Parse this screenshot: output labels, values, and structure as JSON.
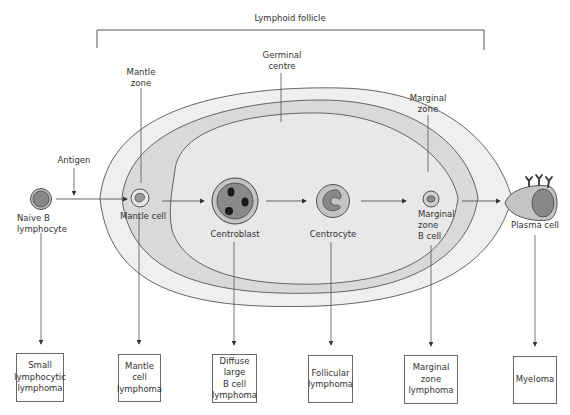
{
  "diagram": {
    "title": "Lymphoid follicle",
    "zones": {
      "mantle": "Mantle\nzone",
      "germinal": "Germinal\ncentre",
      "marginal": "Marginal\nzone"
    },
    "antigen_label": "Antigen",
    "cells": [
      {
        "id": "naive",
        "label": "Naive B\nlymphocyte"
      },
      {
        "id": "mantle",
        "label": "Mantle cell"
      },
      {
        "id": "centroblast",
        "label": "Centroblast"
      },
      {
        "id": "centrocyte",
        "label": "Centrocyte"
      },
      {
        "id": "marginal",
        "label": "Marginal\nzone\nB cell"
      },
      {
        "id": "plasma",
        "label": "Plasma cell"
      }
    ],
    "lymphomas": [
      {
        "label": "Small\nlymphocytic\nlymphoma"
      },
      {
        "label": "Mantle\ncell\nlymphoma"
      },
      {
        "label": "Diffuse\nlarge\nB cell\nlymphoma"
      },
      {
        "label": "Follicular\nlymphoma"
      },
      {
        "label": "Marginal zone\nlymphoma"
      },
      {
        "label": "Myeloma"
      }
    ],
    "colors": {
      "line": "#555555",
      "outer_zone": "#eeeeee",
      "mantle_zone": "#dcdcdc",
      "germinal_centre": "#e8e8e8",
      "cell_outer": "#bdbdbd",
      "cell_inner": "#888888",
      "nucleus_dark": "#1a1a1a"
    }
  }
}
